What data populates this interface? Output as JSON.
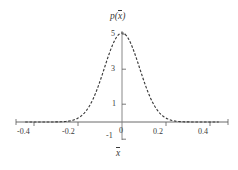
{
  "chart_data": {
    "type": "line",
    "title": "",
    "ylabel": "p(x̄)",
    "xlabel": "x̄",
    "xlim": [
      -0.44,
      0.44
    ],
    "ylim": [
      -1.35,
      5.65
    ],
    "xticks": [
      -0.4,
      -0.2,
      0.2,
      0.4
    ],
    "xticklabels": [
      "-0.4",
      "-0.2",
      "0.2",
      "0.4"
    ],
    "yticks": [
      -1,
      1,
      3,
      5
    ],
    "yticklabels": [
      "-1",
      "1",
      "3",
      "5"
    ],
    "origin_label": "0",
    "grid": false,
    "legend": null,
    "linestyle": "dashed",
    "linecolor": "#3a3a3a",
    "distribution": {
      "kind": "gaussian",
      "mean": 0,
      "sigma": 0.08,
      "peak": 5.0
    },
    "x": [
      -0.4,
      -0.38,
      -0.36,
      -0.34,
      -0.32,
      -0.3,
      -0.28,
      -0.26,
      -0.24,
      -0.22,
      -0.2,
      -0.18,
      -0.16,
      -0.14,
      -0.12,
      -0.1,
      -0.08,
      -0.06,
      -0.04,
      -0.02,
      0.0,
      0.02,
      0.04,
      0.06,
      0.08,
      0.1,
      0.12,
      0.14,
      0.16,
      0.18,
      0.2,
      0.22,
      0.24,
      0.26,
      0.28,
      0.3,
      0.32,
      0.34,
      0.36,
      0.38,
      0.4
    ],
    "y": [
      0.0,
      0.0,
      0.0,
      0.0,
      0.0,
      0.01,
      0.01,
      0.04,
      0.1,
      0.25,
      0.21,
      0.55,
      1.04,
      1.74,
      2.6,
      3.48,
      4.21,
      4.7,
      4.93,
      5.0,
      5.0,
      5.0,
      4.93,
      4.7,
      4.21,
      3.48,
      2.6,
      1.74,
      1.04,
      0.55,
      0.21,
      0.07,
      0.02,
      0.01,
      0.0,
      0.0,
      0.0,
      0.0,
      0.0,
      0.0,
      0.0
    ],
    "axes": {
      "x_axis_y_value": 0,
      "y_axis_x_value": 0,
      "axis_color": "#555555"
    }
  },
  "labels": {
    "y_axis_title": "p(x)",
    "x_axis_title": "x",
    "x_tick_neg_04": "-0.4",
    "x_tick_neg_02": "-0.2",
    "x_tick_pos_02": "0.2",
    "x_tick_pos_04": "0.4",
    "y_tick_5": "5",
    "y_tick_3": "3",
    "y_tick_1": "1",
    "y_tick_neg_1": "-1",
    "origin": "0"
  }
}
